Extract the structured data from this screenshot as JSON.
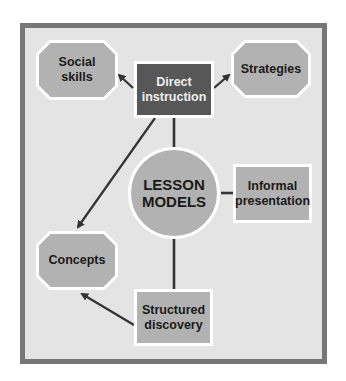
{
  "diagram": {
    "center": {
      "label_line1": "LESSON",
      "label_line2": "MODELS"
    },
    "nodes": {
      "direct_instruction": {
        "line1": "Direct",
        "line2": "instruction"
      },
      "social_skills": {
        "line1": "Social",
        "line2": "skills"
      },
      "strategies": {
        "line1": "Strategies"
      },
      "informal_presentation": {
        "line1": "Informal",
        "line2": "presentation"
      },
      "concepts": {
        "line1": "Concepts"
      },
      "structured_discovery": {
        "line1": "Structured",
        "line2": "discovery"
      }
    },
    "edges": [
      {
        "from": "direct_instruction",
        "to": "social_skills",
        "type": "arrow"
      },
      {
        "from": "direct_instruction",
        "to": "strategies",
        "type": "arrow"
      },
      {
        "from": "direct_instruction",
        "to": "concepts",
        "type": "arrow"
      },
      {
        "from": "direct_instruction",
        "to": "lesson_models",
        "type": "line"
      },
      {
        "from": "lesson_models",
        "to": "informal_presentation",
        "type": "line"
      },
      {
        "from": "lesson_models",
        "to": "structured_discovery",
        "type": "line"
      },
      {
        "from": "structured_discovery",
        "to": "concepts",
        "type": "arrow"
      }
    ],
    "colors": {
      "frame_border": "#777777",
      "frame_fill": "#e4e4e4",
      "node_fill": "#b2b2b2",
      "dark_node_fill": "#575757",
      "edge": "#333333"
    }
  }
}
